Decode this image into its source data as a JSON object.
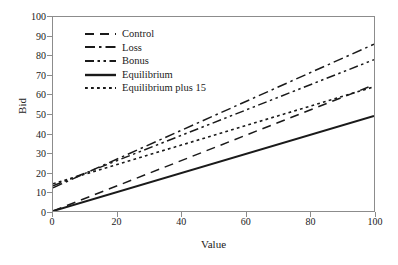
{
  "chart_data": {
    "type": "line",
    "title": "",
    "xlabel": "Value",
    "ylabel": "Bid",
    "xlim": [
      0,
      100
    ],
    "ylim": [
      0,
      100
    ],
    "xticks": [
      0,
      20,
      40,
      60,
      80,
      100
    ],
    "yticks": [
      0,
      10,
      20,
      30,
      40,
      50,
      60,
      70,
      80,
      90,
      100
    ],
    "grid": false,
    "legend_position": "upper-left-inside",
    "x": [
      0,
      100
    ],
    "series": [
      {
        "name": "Control",
        "style": "dashed",
        "values": [
          0,
          65
        ],
        "intercept": 0,
        "slope": 0.65
      },
      {
        "name": "Loss",
        "style": "dash-dot",
        "values": [
          12,
          86
        ],
        "intercept": 12,
        "slope": 0.74
      },
      {
        "name": "Bonus",
        "style": "dash-dot-dot",
        "values": [
          13,
          78
        ],
        "intercept": 13,
        "slope": 0.65
      },
      {
        "name": "Equilibrium",
        "style": "solid",
        "values": [
          0,
          49
        ],
        "intercept": 0,
        "slope": 0.49
      },
      {
        "name": "Equilibrium plus 15",
        "style": "dotted",
        "values": [
          14,
          64
        ],
        "intercept": 14,
        "slope": 0.5
      }
    ],
    "line_color": "#1a1a1a"
  },
  "axes": {
    "ylabel": "Bid",
    "xlabel": "Value",
    "ytick_labels": [
      "0",
      "10",
      "20",
      "30",
      "40",
      "50",
      "60",
      "70",
      "80",
      "90",
      "100"
    ],
    "xtick_labels": [
      "0",
      "20",
      "40",
      "60",
      "80",
      "100"
    ]
  },
  "legend": {
    "items": [
      {
        "label": "Control"
      },
      {
        "label": "Loss"
      },
      {
        "label": "Bonus"
      },
      {
        "label": "Equilibrium"
      },
      {
        "label": "Equilibrium plus 15"
      }
    ]
  }
}
